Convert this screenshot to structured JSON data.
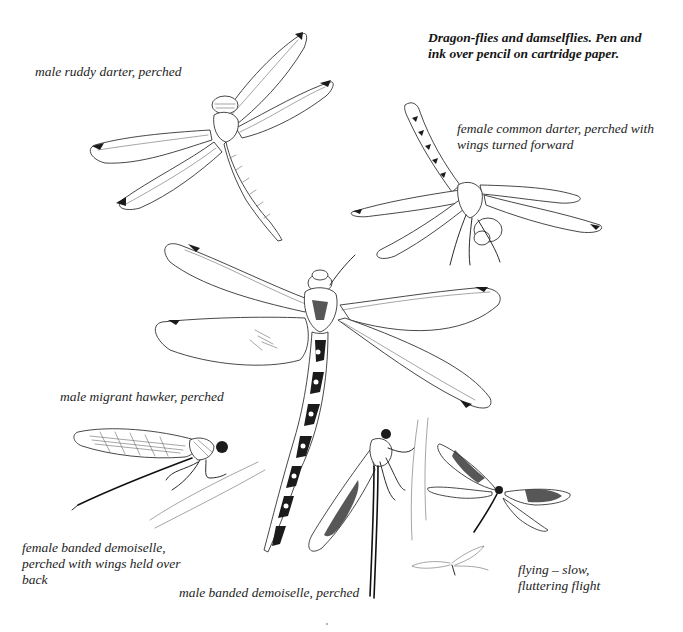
{
  "plate": {
    "title_lines": [
      "Dragon-flies and damselflies.  Pen and",
      "ink over pencil on cartridge paper."
    ],
    "captions": {
      "male_ruddy_darter": [
        "male ruddy darter, perched"
      ],
      "female_common_darter": [
        "female common darter, perched with",
        "wings turned forward"
      ],
      "male_migrant_hawker": [
        "male migrant hawker, perched"
      ],
      "female_banded_demoiselle": [
        "female banded demoiselle,",
        "perched with wings held over",
        "back"
      ],
      "male_banded_demoiselle": [
        "male banded demoiselle, perched"
      ],
      "flying": [
        "flying – slow,",
        "fluttering flight"
      ]
    },
    "illustrations": [
      "male-ruddy-darter-drawing",
      "female-common-darter-drawing",
      "male-migrant-hawker-drawing",
      "female-banded-demoiselle-drawing",
      "male-banded-demoiselle-drawing",
      "flying-demoiselle-drawing",
      "small-flying-demoiselle-drawing"
    ]
  },
  "colors": {
    "background": "#ffffff",
    "ink": "#1b1b1b",
    "text": "#1d1d1d"
  }
}
